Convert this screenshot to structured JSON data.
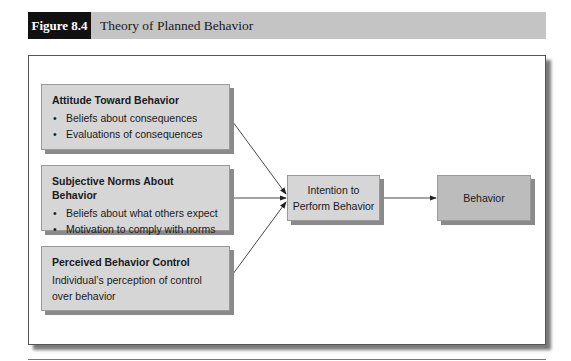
{
  "figure": {
    "label": "Figure 8.4",
    "title": "Theory of Planned Behavior"
  },
  "diagram": {
    "inputs": [
      {
        "title": "Attitude Toward Behavior",
        "bullets": [
          "Beliefs about consequences",
          "Evaluations of consequences"
        ]
      },
      {
        "title": "Subjective Norms About Behavior",
        "bullets": [
          "Beliefs about what others expect",
          "Motivation to comply with norms"
        ]
      },
      {
        "title": "Perceived Behavior Control",
        "description_line1": "Individual’s perception of control",
        "description_line2": "over behavior"
      }
    ],
    "intention": {
      "line1": "Intention to",
      "line2": "Perform Behavior"
    },
    "outcome": {
      "label": "Behavior"
    },
    "colors": {
      "input_box_fill": "#d6d6d6",
      "behavior_box_fill": "#bcbcbc",
      "header_bar": "#c4c4c4",
      "figure_label_bg": "#111111"
    }
  }
}
